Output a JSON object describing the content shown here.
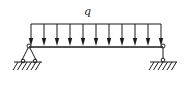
{
  "diagram": {
    "type": "simply-supported-beam",
    "load": {
      "kind": "uniformly-distributed",
      "label": "q",
      "arrow_count": 11,
      "direction": "down"
    },
    "supports": {
      "left": "pinned-support",
      "right": "roller-support"
    },
    "colors": {
      "line": "#1a1a1a",
      "background": "#ffffff"
    }
  }
}
